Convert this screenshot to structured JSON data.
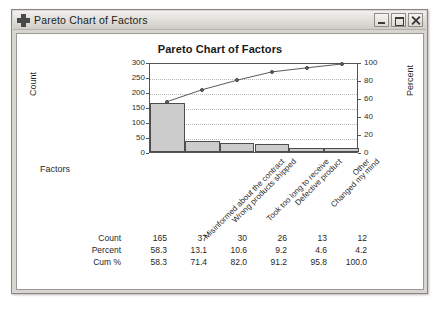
{
  "window": {
    "title": "Pareto Chart of Factors",
    "icon": "crosshair-plus-icon",
    "minimize_label": "Minimize",
    "maximize_label": "Maximize",
    "close_label": "Close"
  },
  "chart_data": {
    "type": "bar",
    "title": "Pareto Chart of Factors",
    "xlabel": "Factors",
    "ylabel": "Count",
    "y2label": "Percent",
    "categories": [
      "Misinformed about the contract",
      "Wrong products shipped",
      "Took too long to receive",
      "Defective product",
      "Changed my mind",
      "Other"
    ],
    "values": [
      165,
      37,
      30,
      26,
      13,
      12
    ],
    "percent": [
      58.3,
      13.1,
      10.6,
      9.2,
      4.6,
      4.2
    ],
    "cumulative_percent": [
      58.3,
      71.4,
      82.0,
      91.2,
      95.8,
      100.0
    ],
    "ylim": [
      0,
      300
    ],
    "y2lim": [
      0,
      100
    ],
    "yticks": [
      300,
      250,
      200,
      150,
      100,
      50,
      0
    ],
    "y2ticks": [
      100,
      80,
      60,
      40,
      20,
      0
    ],
    "grid": true,
    "legend": "none",
    "series": [
      {
        "name": "Count",
        "type": "bar",
        "values": [
          165,
          37,
          30,
          26,
          13,
          12
        ]
      },
      {
        "name": "Cum %",
        "type": "line",
        "values": [
          58.3,
          71.4,
          82.0,
          91.2,
          95.8,
          100.0
        ]
      }
    ],
    "bar_color": "#cccccc",
    "bar_edge_color": "#4d4d4d",
    "line_color": "#5a5a5a"
  },
  "table": {
    "rows": [
      {
        "label": "Count",
        "values": [
          "165",
          "37",
          "30",
          "26",
          "13",
          "12"
        ]
      },
      {
        "label": "Percent",
        "values": [
          "58.3",
          "13.1",
          "10.6",
          "9.2",
          "4.6",
          "4.2"
        ]
      },
      {
        "label": "Cum %",
        "values": [
          "58.3",
          "71.4",
          "82.0",
          "91.2",
          "95.8",
          "100.0"
        ]
      }
    ]
  }
}
